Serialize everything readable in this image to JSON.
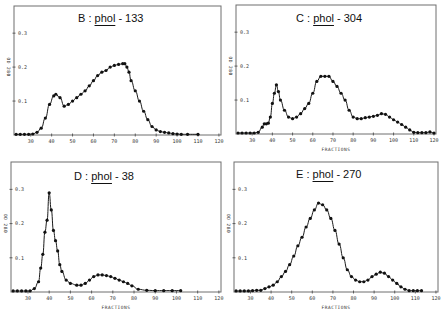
{
  "chart_data": [
    {
      "type": "line",
      "panel": "B",
      "title": "B : phol - 133",
      "title_parts": {
        "letter": "B",
        "sep": ":",
        "gene": "phol",
        "allele": "- 133"
      },
      "xlabel": "",
      "ylabel": "OD 280",
      "xticks": [
        30,
        40,
        50,
        60,
        70,
        80,
        90,
        100,
        110,
        120
      ],
      "yticks": [
        0.1,
        0.2,
        0.3
      ],
      "xlim": [
        22,
        121
      ],
      "ylim": [
        0,
        0.38
      ],
      "grid": false,
      "markers": true,
      "series": [
        {
          "name": "phol-133",
          "x": [
            23,
            25,
            27,
            29,
            31,
            33,
            35,
            37,
            39,
            41,
            42,
            44,
            46,
            48,
            50,
            52,
            54,
            56,
            58,
            60,
            62,
            64,
            66,
            68,
            70,
            72,
            74,
            75,
            76,
            77,
            78,
            80,
            82,
            84,
            86,
            88,
            90,
            92,
            94,
            96,
            98,
            100,
            102,
            105,
            110
          ],
          "y": [
            0.002,
            0.002,
            0.002,
            0.002,
            0.003,
            0.008,
            0.02,
            0.05,
            0.09,
            0.115,
            0.12,
            0.11,
            0.085,
            0.09,
            0.1,
            0.11,
            0.12,
            0.13,
            0.145,
            0.16,
            0.175,
            0.185,
            0.19,
            0.2,
            0.205,
            0.208,
            0.21,
            0.21,
            0.2,
            0.185,
            0.16,
            0.13,
            0.1,
            0.07,
            0.045,
            0.025,
            0.015,
            0.01,
            0.008,
            0.006,
            0.004,
            0.003,
            0.002,
            0.002,
            0.002
          ]
        }
      ]
    },
    {
      "type": "line",
      "panel": "C",
      "title": "C : phol - 304",
      "title_parts": {
        "letter": "C",
        "sep": ":",
        "gene": "phol",
        "allele": "- 304"
      },
      "xlabel": "FRACTIONS",
      "ylabel": "OD 280",
      "xticks": [
        30,
        40,
        50,
        60,
        70,
        80,
        90,
        100,
        110,
        120
      ],
      "yticks": [
        0.1,
        0.2,
        0.3
      ],
      "xlim": [
        22,
        121
      ],
      "ylim": [
        0,
        0.38
      ],
      "grid": false,
      "markers": true,
      "series": [
        {
          "name": "phol-304",
          "x": [
            23,
            25,
            27,
            29,
            31,
            33,
            35,
            36,
            37,
            38,
            39,
            40,
            41,
            42,
            43,
            44,
            46,
            48,
            50,
            52,
            54,
            56,
            58,
            60,
            62,
            64,
            66,
            68,
            70,
            72,
            74,
            76,
            78,
            80,
            82,
            84,
            86,
            88,
            90,
            92,
            94,
            96,
            98,
            100,
            102,
            104,
            106,
            108,
            110,
            112,
            114,
            116,
            118,
            120
          ],
          "y": [
            0.003,
            0.003,
            0.003,
            0.003,
            0.003,
            0.005,
            0.02,
            0.03,
            0.03,
            0.032,
            0.05,
            0.09,
            0.12,
            0.145,
            0.125,
            0.1,
            0.07,
            0.05,
            0.045,
            0.05,
            0.06,
            0.075,
            0.09,
            0.12,
            0.155,
            0.17,
            0.17,
            0.17,
            0.155,
            0.14,
            0.12,
            0.1,
            0.07,
            0.05,
            0.045,
            0.045,
            0.048,
            0.05,
            0.052,
            0.055,
            0.06,
            0.058,
            0.05,
            0.042,
            0.035,
            0.028,
            0.02,
            0.012,
            0.005,
            0.004,
            0.004,
            0.004,
            0.006,
            0.003
          ]
        }
      ]
    },
    {
      "type": "line",
      "panel": "D",
      "title": "D : phol - 38",
      "title_parts": {
        "letter": "D",
        "sep": ":",
        "gene": "phol",
        "allele": "- 38"
      },
      "xlabel": "FRACTIONS",
      "ylabel": "OD 280",
      "xticks": [
        30,
        40,
        50,
        60,
        70,
        80,
        90,
        100,
        110,
        120
      ],
      "yticks": [
        0.1,
        0.2,
        0.3
      ],
      "xlim": [
        22,
        121
      ],
      "ylim": [
        0,
        0.38
      ],
      "grid": false,
      "markers": true,
      "series": [
        {
          "name": "phol-38",
          "x": [
            23,
            25,
            27,
            29,
            31,
            33,
            35,
            36,
            37,
            38,
            39,
            40,
            41,
            42,
            43,
            44,
            45,
            46,
            48,
            50,
            53,
            55,
            57,
            59,
            61,
            63,
            65,
            67,
            69,
            71,
            73,
            75,
            77,
            79,
            82,
            86,
            90,
            94,
            98,
            102
          ],
          "y": [
            0.003,
            0.003,
            0.003,
            0.003,
            0.003,
            0.01,
            0.03,
            0.07,
            0.11,
            0.175,
            0.21,
            0.29,
            0.24,
            0.18,
            0.15,
            0.12,
            0.08,
            0.06,
            0.035,
            0.025,
            0.02,
            0.02,
            0.025,
            0.035,
            0.045,
            0.05,
            0.05,
            0.048,
            0.045,
            0.04,
            0.035,
            0.03,
            0.025,
            0.018,
            0.008,
            0.005,
            0.004,
            0.004,
            0.004,
            0.004
          ]
        }
      ]
    },
    {
      "type": "line",
      "panel": "E",
      "title": "E : phol - 270",
      "title_parts": {
        "letter": "E",
        "sep": ":",
        "gene": "phol",
        "allele": "- 270"
      },
      "xlabel": "FRACTIONS",
      "ylabel": "OD 280",
      "xticks": [
        30,
        40,
        50,
        60,
        70,
        80,
        90,
        100,
        110,
        120
      ],
      "yticks": [
        0.1,
        0.2,
        0.3
      ],
      "xlim": [
        22,
        121
      ],
      "ylim": [
        0,
        0.38
      ],
      "grid": false,
      "markers": true,
      "series": [
        {
          "name": "phol-270",
          "x": [
            23,
            25,
            27,
            29,
            31,
            33,
            35,
            37,
            39,
            41,
            43,
            45,
            47,
            49,
            51,
            53,
            55,
            57,
            59,
            61,
            63,
            65,
            67,
            69,
            71,
            73,
            75,
            77,
            79,
            81,
            83,
            85,
            87,
            89,
            91,
            93,
            95,
            97,
            99,
            101,
            103,
            105,
            107,
            109,
            111,
            113
          ],
          "y": [
            0.003,
            0.003,
            0.003,
            0.003,
            0.004,
            0.005,
            0.005,
            0.01,
            0.015,
            0.02,
            0.03,
            0.045,
            0.06,
            0.08,
            0.105,
            0.135,
            0.16,
            0.19,
            0.215,
            0.24,
            0.26,
            0.255,
            0.24,
            0.215,
            0.18,
            0.14,
            0.1,
            0.065,
            0.045,
            0.035,
            0.03,
            0.03,
            0.035,
            0.045,
            0.052,
            0.058,
            0.055,
            0.045,
            0.035,
            0.025,
            0.015,
            0.008,
            0.004,
            0.004,
            0.004,
            0.004
          ]
        }
      ]
    }
  ],
  "layout_panels": [
    {
      "id": "B",
      "left": 0,
      "top": 0,
      "frame": {
        "x0": 14,
        "y0": 6,
        "x1": 221,
        "y1": 135
      },
      "title_pos": {
        "x": 78,
        "y": 12
      }
    },
    {
      "id": "C",
      "left": 222,
      "top": 0,
      "frame": {
        "x0": 14,
        "y0": 5,
        "x1": 214,
        "y1": 134
      },
      "title_pos": {
        "x": 74,
        "y": 12
      }
    },
    {
      "id": "D",
      "left": 0,
      "top": 158,
      "frame": {
        "x0": 11,
        "y0": 4,
        "x1": 221,
        "y1": 134
      },
      "title_pos": {
        "x": 74,
        "y": 12
      }
    },
    {
      "id": "E",
      "left": 222,
      "top": 158,
      "frame": {
        "x0": 12,
        "y0": 4,
        "x1": 216,
        "y1": 134
      },
      "title_pos": {
        "x": 74,
        "y": 10
      }
    }
  ]
}
